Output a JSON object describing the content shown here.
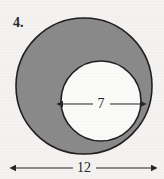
{
  "figure": {
    "problem_number": "4.",
    "background_color": "#f4f3f1",
    "annulus_fill_color": "#8a8a8a",
    "inner_circle_fill_color": "#fbfbfa",
    "stroke_color": "#231f1f",
    "outer_circle": {
      "center_x": 84,
      "center_y": 86,
      "radius": 68,
      "diameter_label": "12"
    },
    "inner_circle": {
      "center_x": 101,
      "center_y": 101,
      "radius": 40,
      "diameter_label": "7"
    },
    "dimensions": [
      {
        "name": "inner-diameter",
        "label": "7",
        "x1": 63,
        "x2": 140,
        "y": 104,
        "label_x": 101,
        "label_y": 108
      },
      {
        "name": "outer-diameter",
        "label": "12",
        "x1": 16,
        "x2": 151,
        "y": 168,
        "label_x": 84,
        "label_y": 172
      }
    ],
    "problem_number_position": {
      "x": 13,
      "y": 27
    }
  }
}
